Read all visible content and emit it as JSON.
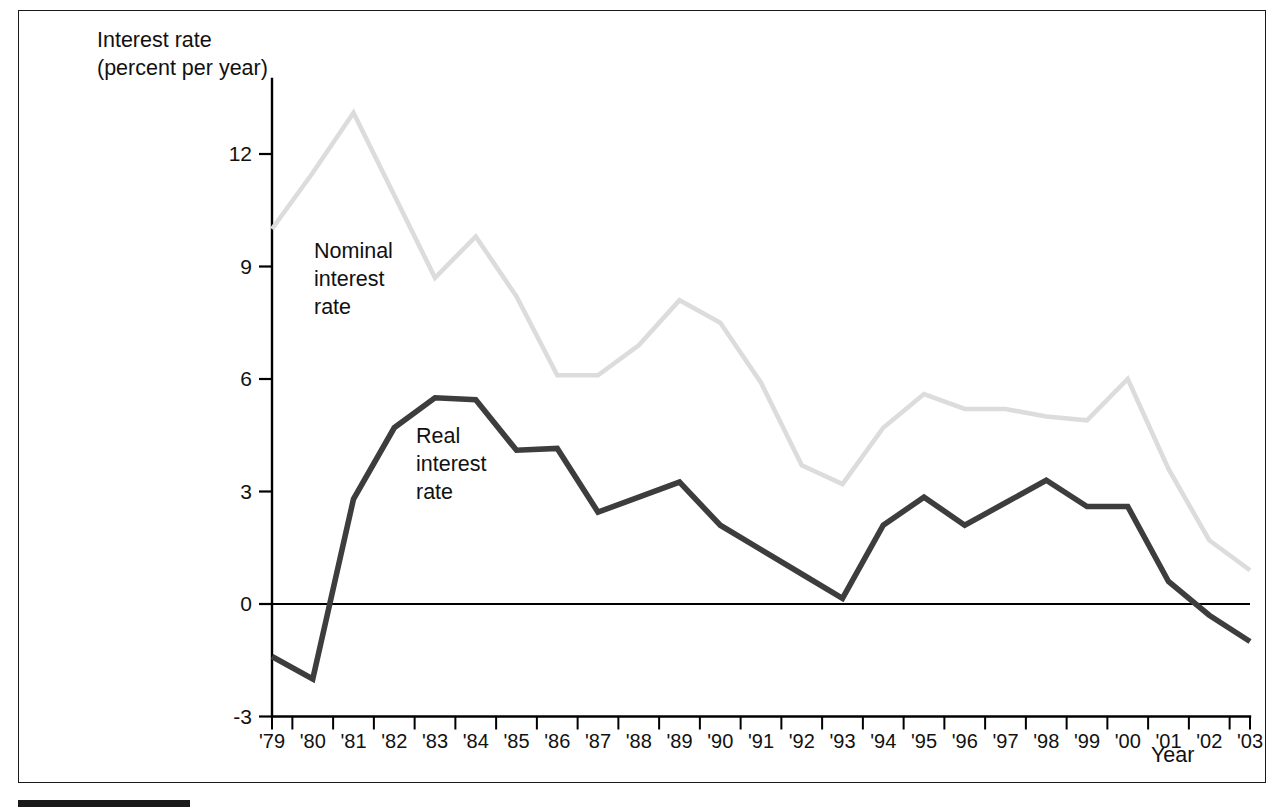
{
  "figure": {
    "axis_title_line1": "Interest rate",
    "axis_title_line2": "(percent per year)",
    "x_axis_title": "Year",
    "nominal_label_line1": "Nominal",
    "nominal_label_line2": "interest",
    "nominal_label_line3": "rate",
    "real_label_line1": "Real",
    "real_label_line2": "interest",
    "real_label_line3": "rate"
  },
  "colors": {
    "nominal_series": "#dcdcdc",
    "real_series": "#3d3d3d",
    "axis": "#000000",
    "frame": "#1a1a1a",
    "background": "#ffffff"
  },
  "chart_data": {
    "type": "line",
    "title": "",
    "subtitle": "",
    "xlabel": "Year",
    "ylabel": "Interest rate (percent per year)",
    "ylim": [
      -3,
      14
    ],
    "xlim": [
      "'79",
      "'03"
    ],
    "ytick_labels": [
      "12",
      "9",
      "6",
      "3",
      "0",
      "-3"
    ],
    "ytick_values": [
      12,
      9,
      6,
      3,
      0,
      -3
    ],
    "grid": false,
    "legend_position": "inline-annotation",
    "x": [
      "'79",
      "'80",
      "'81",
      "'82",
      "'83",
      "'84",
      "'85",
      "'86",
      "'87",
      "'88",
      "'89",
      "'90",
      "'91",
      "'92",
      "'93",
      "'94",
      "'95",
      "'96",
      "'97",
      "'98",
      "'99",
      "'00",
      "'01",
      "'02",
      "'03"
    ],
    "categories": [
      "'79",
      "'80",
      "'81",
      "'82",
      "'83",
      "'84",
      "'85",
      "'86",
      "'87",
      "'88",
      "'89",
      "'90",
      "'91",
      "'92",
      "'93",
      "'94",
      "'95",
      "'96",
      "'97",
      "'98",
      "'99",
      "'00",
      "'01",
      "'02",
      "'03"
    ],
    "series": [
      {
        "name": "Nominal interest rate",
        "color": "#dcdcdc",
        "values": [
          10.0,
          11.5,
          13.1,
          10.9,
          8.7,
          9.8,
          8.2,
          6.1,
          6.1,
          6.9,
          8.1,
          7.5,
          5.9,
          3.7,
          3.2,
          4.7,
          5.6,
          5.2,
          5.2,
          5.0,
          4.9,
          6.0,
          3.6,
          1.7,
          0.9
        ]
      },
      {
        "name": "Real interest rate",
        "color": "#3d3d3d",
        "values": [
          -1.4,
          -2.0,
          2.8,
          4.7,
          5.5,
          5.45,
          4.1,
          4.15,
          2.45,
          2.85,
          3.25,
          2.1,
          1.45,
          0.8,
          0.15,
          2.1,
          2.85,
          2.1,
          2.7,
          3.3,
          2.6,
          2.6,
          0.6,
          -0.3,
          -1.0
        ]
      }
    ],
    "annotations": [
      {
        "text": "Nominal interest rate",
        "x": "'81",
        "y": 7.5
      },
      {
        "text": "Real interest rate",
        "x": "'83",
        "y": 4.0
      }
    ]
  }
}
